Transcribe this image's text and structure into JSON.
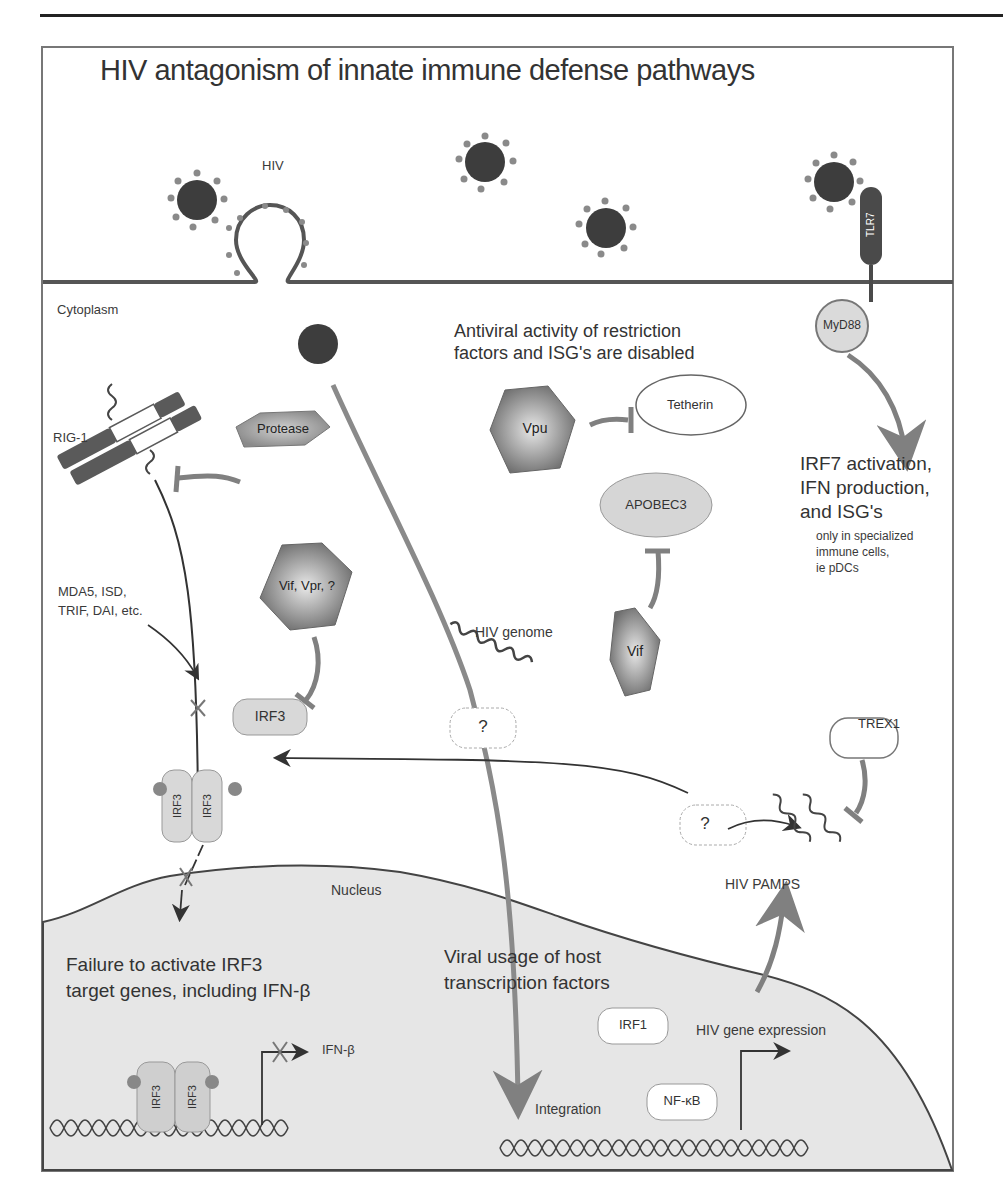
{
  "title": "HIV antagonism of innate immune defense pathways",
  "colors": {
    "frame": "#777777",
    "membrane": "#555555",
    "virion": "#3d3d3d",
    "spike": "#8a8a8a",
    "viral_protein": "#7a7a7a",
    "host_protein": "#d6d6d6",
    "nucleus_fill": "#e6e6e6",
    "inhibition_arrow": "#808080"
  },
  "compartments": {
    "extracellular_virus_label": "HIV",
    "cytoplasm": "Cytoplasm",
    "nucleus": "Nucleus"
  },
  "receptors": {
    "tlr7": "TLR7",
    "myd88": "MyD88",
    "rig1": "RIG-1",
    "other_sensors": [
      "MDA5, ISD,",
      "TRIF, DAI, etc."
    ]
  },
  "viral_proteins": {
    "protease": "Protease",
    "vif_vpr": "Vif, Vpr, ?",
    "vpu": "Vpu",
    "vif": "Vif"
  },
  "host_factors": {
    "tetherin": "Tetherin",
    "apobec3": "APOBEC3",
    "irf3": "IRF3",
    "irf3_dimer": [
      "IRF3",
      "IRF3"
    ],
    "phospho": "P",
    "trex1": "TREX1",
    "irf1": "IRF1",
    "nfkb": "NF-κB",
    "unknown": "?"
  },
  "annotations": {
    "restriction_heading": [
      "Antiviral activity of restriction",
      "factors and ISG's are disabled"
    ],
    "irf7_heading": [
      "IRF7 activation,",
      "IFN production,",
      "and ISG's"
    ],
    "irf7_note": [
      "only in specialized",
      "immune cells,",
      "ie pDCs"
    ],
    "hiv_genome": "HIV genome",
    "hiv_pamps": "HIV PAMPS",
    "failure_heading": [
      "Failure to activate IRF3",
      "target genes, including IFN-β"
    ],
    "ifn_beta": "IFN-β",
    "viral_usage_heading": [
      "Viral usage of host",
      "transcription factors"
    ],
    "integration": "Integration",
    "hiv_gene_expression": "HIV gene expression"
  }
}
